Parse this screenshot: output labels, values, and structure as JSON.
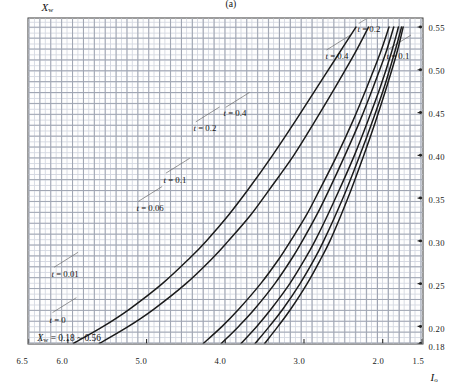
{
  "figure": {
    "caption": "(a)",
    "annotation_prefix": "X",
    "annotation_sub": "w",
    "annotation_value": "= 0.18 ~ 0.56"
  },
  "chart_data": {
    "type": "line",
    "title": "",
    "annotation": "Xw = 0.18 ~ 0.56",
    "xlabel": "Xw",
    "ylabel": "I",
    "xlabel_base": "X",
    "xlabel_sub": "w",
    "ylabel_base": "I",
    "ylabel_sub": "o",
    "xlim": [
      0.18,
      0.56
    ],
    "ylim": [
      1.5,
      6.5
    ],
    "grid": true,
    "grid_type": "graph-paper",
    "legend_position": "inline-curve-labels",
    "xticks": [
      "0.18",
      "0.20",
      "0.25",
      "0.30",
      "0.35",
      "0.40",
      "0.45",
      "0.50",
      "0.55"
    ],
    "xtick_values": [
      0.18,
      0.2,
      0.25,
      0.3,
      0.35,
      0.4,
      0.45,
      0.5,
      0.55
    ],
    "yticks": [
      "1.5",
      "2.0",
      "3.0",
      "4.0",
      "5.0",
      "6.0",
      "6.5"
    ],
    "ytick_values": [
      1.5,
      2.0,
      3.0,
      4.0,
      5.0,
      6.0,
      6.5
    ],
    "series": [
      {
        "name": "t = 0",
        "t": 0,
        "label": "t = 0",
        "x": [
          0.18,
          0.2,
          0.22,
          0.25,
          0.28,
          0.3,
          0.33,
          0.36,
          0.4,
          0.44,
          0.48,
          0.52,
          0.55
        ],
        "values": [
          5.93,
          5.55,
          5.22,
          4.8,
          4.45,
          4.24,
          3.96,
          3.71,
          3.4,
          3.11,
          2.83,
          2.55,
          2.34
        ]
      },
      {
        "name": "t = 0.01",
        "t": 0.01,
        "label": "t = 0.01",
        "x": [
          0.18,
          0.2,
          0.22,
          0.25,
          0.28,
          0.3,
          0.33,
          0.36,
          0.4,
          0.44,
          0.48,
          0.52,
          0.55
        ],
        "values": [
          5.6,
          5.23,
          4.91,
          4.5,
          4.16,
          3.96,
          3.68,
          3.44,
          3.13,
          2.86,
          2.6,
          2.35,
          2.18
        ]
      },
      {
        "name": "t = 0.06",
        "t": 0.06,
        "label": "t = 0.06",
        "x": [
          0.18,
          0.2,
          0.22,
          0.25,
          0.28,
          0.3,
          0.33,
          0.36,
          0.4,
          0.44,
          0.48,
          0.52,
          0.55
        ],
        "values": [
          4.28,
          4.04,
          3.83,
          3.55,
          3.31,
          3.17,
          2.97,
          2.8,
          2.58,
          2.38,
          2.2,
          2.03,
          1.92
        ]
      },
      {
        "name": "t = 0.1",
        "t": 0.1,
        "label": "t = 0.1",
        "x": [
          0.18,
          0.2,
          0.22,
          0.25,
          0.28,
          0.3,
          0.33,
          0.36,
          0.4,
          0.44,
          0.48,
          0.52,
          0.55
        ],
        "values": [
          4.05,
          3.83,
          3.63,
          3.37,
          3.15,
          3.02,
          2.84,
          2.68,
          2.48,
          2.29,
          2.12,
          1.96,
          1.86
        ]
      },
      {
        "name": "t = 0.2",
        "t": 0.2,
        "label": "t = 0.2",
        "x": [
          0.18,
          0.2,
          0.22,
          0.25,
          0.28,
          0.3,
          0.33,
          0.36,
          0.4,
          0.44,
          0.48,
          0.52,
          0.55
        ],
        "values": [
          3.8,
          3.6,
          3.42,
          3.18,
          2.98,
          2.86,
          2.7,
          2.55,
          2.36,
          2.19,
          2.03,
          1.89,
          1.8
        ]
      },
      {
        "name": "t = 0.4",
        "t": 0.4,
        "label": "t = 0.4",
        "x": [
          0.18,
          0.2,
          0.22,
          0.25,
          0.28,
          0.3,
          0.33,
          0.36,
          0.4,
          0.44,
          0.48,
          0.52,
          0.55
        ],
        "values": [
          3.62,
          3.44,
          3.27,
          3.05,
          2.86,
          2.75,
          2.6,
          2.46,
          2.29,
          2.13,
          1.98,
          1.85,
          1.76
        ]
      },
      {
        "name": "t = 0.4 (upper)",
        "t": 0.4,
        "label": "t = 0.4",
        "x": [
          0.18,
          0.2,
          0.22,
          0.25,
          0.28,
          0.3,
          0.33,
          0.36,
          0.4,
          0.44,
          0.48,
          0.52,
          0.55
        ],
        "values": [
          3.5,
          3.33,
          3.17,
          2.96,
          2.78,
          2.67,
          2.53,
          2.4,
          2.24,
          2.09,
          1.95,
          1.82,
          1.74
        ]
      }
    ],
    "curve_labels": [
      {
        "text_italic": "t",
        "text": " = 0",
        "x": 0.215,
        "y": 6.22
      },
      {
        "text_italic": "t",
        "text": " = 0.01",
        "x": 0.268,
        "y": 6.2
      },
      {
        "text_italic": "t",
        "text": " = 0.06",
        "x": 0.345,
        "y": 5.13
      },
      {
        "text_italic": "t",
        "text": " = 0.1",
        "x": 0.378,
        "y": 4.78
      },
      {
        "text_italic": "t",
        "text": " = 0.2",
        "x": 0.438,
        "y": 4.4
      },
      {
        "text_italic": "t",
        "text": " = 0.4",
        "x": 0.455,
        "y": 4.02
      },
      {
        "text_italic": "t",
        "text": " = 0.4",
        "x": 0.522,
        "y": 2.74
      },
      {
        "text_italic": "t",
        "text": " = 0.2",
        "x": 0.553,
        "y": 2.33
      },
      {
        "text_italic": "t",
        "text": " = 0.1",
        "x": 0.522,
        "y": 1.97
      }
    ]
  }
}
